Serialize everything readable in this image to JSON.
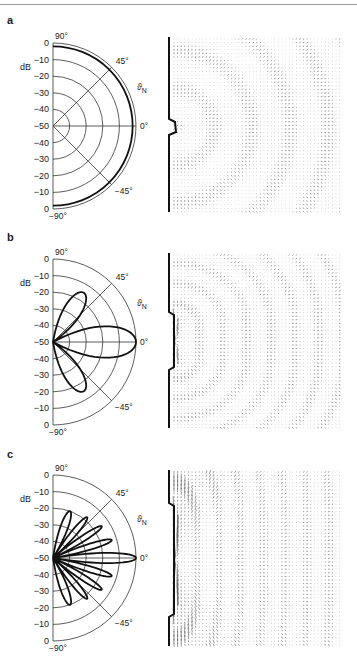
{
  "figure": {
    "panels": [
      {
        "letter": "a",
        "unit_label": "dB",
        "theta_label": "ϑ",
        "theta_sub": "N",
        "angle_labels": [
          "90°",
          "45°",
          "0°",
          "-45°",
          "-90°"
        ],
        "db_ticks_upper": [
          "0",
          "−10",
          "−20",
          "−30",
          "−40",
          "−50"
        ],
        "db_ticks_lower": [
          "−40",
          "−30",
          "−20",
          "−10",
          "0"
        ],
        "wall_notch": "small protrusion",
        "field_pattern": "circular wavefronts from small source"
      },
      {
        "letter": "b",
        "unit_label": "dB",
        "theta_label": "ϑ",
        "theta_sub": "N",
        "angle_labels": [
          "90°",
          "45°",
          "0°",
          "-45°",
          "-90°"
        ],
        "db_ticks_upper": [
          "0",
          "−10",
          "−20",
          "−30",
          "−40",
          "−50"
        ],
        "db_ticks_lower": [
          "−40",
          "−30",
          "−20",
          "−10",
          "0"
        ],
        "wall_notch": "medium aperture",
        "field_pattern": "curved wavefronts"
      },
      {
        "letter": "c",
        "unit_label": "dB",
        "theta_label": "ϑ",
        "theta_sub": "N",
        "angle_labels": [
          "90°",
          "45°",
          "0°",
          "-45°",
          "-90°"
        ],
        "db_ticks_upper": [
          "0",
          "−10",
          "−20",
          "−30",
          "−40",
          "−50"
        ],
        "db_ticks_lower": [
          "−40",
          "−30",
          "−20",
          "−10",
          "0"
        ],
        "wall_notch": "large aperture",
        "field_pattern": "nearly plane wavefronts"
      }
    ]
  },
  "chart_data": [
    {
      "type": "polar",
      "title": "a",
      "rlabel": "dB",
      "r_range": [
        -50,
        0
      ],
      "r_ticks": [
        0,
        -10,
        -20,
        -30,
        -40,
        -50
      ],
      "theta_range_deg": [
        -90,
        90
      ],
      "theta_ticks_deg": [
        90,
        45,
        0,
        -45,
        -90
      ],
      "series": [
        {
          "name": "directivity",
          "description": "omnidirectional, near-constant level",
          "theta_deg": [
            -90,
            -45,
            0,
            45,
            90
          ],
          "level_db": [
            -2,
            -2,
            -2,
            -2,
            -2
          ]
        }
      ]
    },
    {
      "type": "polar",
      "title": "b",
      "rlabel": "dB",
      "r_range": [
        -50,
        0
      ],
      "r_ticks": [
        0,
        -10,
        -20,
        -30,
        -40,
        -50
      ],
      "theta_range_deg": [
        -90,
        90
      ],
      "theta_ticks_deg": [
        90,
        45,
        0,
        -45,
        -90
      ],
      "series": [
        {
          "name": "directivity",
          "description": "main lobe + one side lobe pair",
          "lobes": [
            {
              "center_deg": 0,
              "peak_db": 0,
              "halfwidth_deg": 28
            },
            {
              "center_deg": 58,
              "peak_db": -15,
              "halfwidth_deg": 22
            },
            {
              "center_deg": -58,
              "peak_db": -15,
              "halfwidth_deg": 22
            }
          ]
        }
      ]
    },
    {
      "type": "polar",
      "title": "c",
      "rlabel": "dB",
      "r_range": [
        -50,
        0
      ],
      "r_ticks": [
        0,
        -10,
        -20,
        -30,
        -40,
        -50
      ],
      "theta_range_deg": [
        -90,
        90
      ],
      "theta_ticks_deg": [
        90,
        45,
        0,
        -45,
        -90
      ],
      "series": [
        {
          "name": "directivity",
          "description": "narrow main lobe + multiple side lobes",
          "lobes": [
            {
              "center_deg": 0,
              "peak_db": 0,
              "halfwidth_deg": 9
            },
            {
              "center_deg": 17,
              "peak_db": -13,
              "halfwidth_deg": 7
            },
            {
              "center_deg": -17,
              "peak_db": -13,
              "halfwidth_deg": 7
            },
            {
              "center_deg": 33,
              "peak_db": -15,
              "halfwidth_deg": 7
            },
            {
              "center_deg": -33,
              "peak_db": -15,
              "halfwidth_deg": 7
            },
            {
              "center_deg": 50,
              "peak_db": -18,
              "halfwidth_deg": 8
            },
            {
              "center_deg": -50,
              "peak_db": -18,
              "halfwidth_deg": 8
            },
            {
              "center_deg": 70,
              "peak_db": -20,
              "halfwidth_deg": 11
            },
            {
              "center_deg": -70,
              "peak_db": -20,
              "halfwidth_deg": 11
            }
          ]
        }
      ]
    }
  ]
}
